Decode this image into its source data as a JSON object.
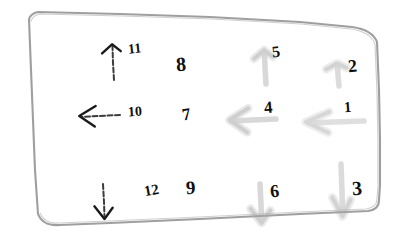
{
  "scene": {
    "medium": "hand-drawn ink sketch on white paper",
    "frame_name": "hand-drawn-rounded-rectangle-border",
    "background_color": "#ffffff",
    "ink_color": "#1a1a1a",
    "faint_ink_color": "#a8a8a8",
    "frame_color": "#8b8b8b"
  },
  "grid": {
    "rows": 3,
    "columns": 4,
    "row_directions": [
      "up",
      "left",
      "down"
    ]
  },
  "items": [
    {
      "label": "11",
      "direction": "up",
      "has_arrow": true,
      "ink": "dark",
      "arrow_x": 96,
      "arrow_y": 38,
      "arrow_w": 26,
      "arrow_h": 38,
      "label_x": 128,
      "label_y": 42,
      "label_size": 14,
      "label_rotate": -6,
      "opacity": 1
    },
    {
      "label": "8",
      "direction": "none",
      "has_arrow": false,
      "ink": "dark",
      "arrow_x": 0,
      "arrow_y": 0,
      "arrow_w": 0,
      "arrow_h": 0,
      "label_x": 176,
      "label_y": 54,
      "label_size": 20,
      "label_rotate": -4,
      "opacity": 1
    },
    {
      "label": "5",
      "direction": "up",
      "has_arrow": true,
      "ink": "faint",
      "arrow_x": 248,
      "arrow_y": 44,
      "arrow_w": 26,
      "arrow_h": 36,
      "label_x": 272,
      "label_y": 44,
      "label_size": 16,
      "label_rotate": -8,
      "opacity": 0.55
    },
    {
      "label": "2",
      "direction": "up",
      "has_arrow": true,
      "ink": "faint",
      "arrow_x": 320,
      "arrow_y": 58,
      "arrow_w": 28,
      "arrow_h": 24,
      "label_x": 348,
      "label_y": 57,
      "label_size": 18,
      "label_rotate": -5,
      "opacity": 0.5
    },
    {
      "label": "10",
      "direction": "left",
      "has_arrow": true,
      "ink": "dark",
      "arrow_x": 74,
      "arrow_y": 100,
      "arrow_w": 42,
      "arrow_h": 24,
      "label_x": 128,
      "label_y": 105,
      "label_size": 14,
      "label_rotate": -4,
      "opacity": 1
    },
    {
      "label": "7",
      "direction": "none",
      "has_arrow": false,
      "ink": "dark",
      "arrow_x": 0,
      "arrow_y": 0,
      "arrow_w": 0,
      "arrow_h": 0,
      "label_x": 182,
      "label_y": 106,
      "label_size": 17,
      "label_rotate": -9,
      "opacity": 1
    },
    {
      "label": "4",
      "direction": "left",
      "has_arrow": true,
      "ink": "faint",
      "arrow_x": 224,
      "arrow_y": 102,
      "arrow_w": 48,
      "arrow_h": 28,
      "label_x": 264,
      "label_y": 99,
      "label_size": 17,
      "label_rotate": -5,
      "opacity": 0.55
    },
    {
      "label": "1",
      "direction": "left",
      "has_arrow": true,
      "ink": "faint",
      "arrow_x": 300,
      "arrow_y": 106,
      "arrow_w": 60,
      "arrow_h": 24,
      "label_x": 344,
      "label_y": 100,
      "label_size": 15,
      "label_rotate": -4,
      "opacity": 0.45
    },
    {
      "label": "12",
      "direction": "down",
      "has_arrow": true,
      "ink": "dark",
      "arrow_x": 88,
      "arrow_y": 180,
      "arrow_w": 24,
      "arrow_h": 36,
      "label_x": 144,
      "label_y": 183,
      "label_size": 15,
      "label_rotate": -10,
      "opacity": 1
    },
    {
      "label": "9",
      "direction": "none",
      "has_arrow": false,
      "ink": "dark",
      "arrow_x": 0,
      "arrow_y": 0,
      "arrow_w": 0,
      "arrow_h": 0,
      "label_x": 186,
      "label_y": 178,
      "label_size": 19,
      "label_rotate": -3,
      "opacity": 1
    },
    {
      "label": "6",
      "direction": "down",
      "has_arrow": true,
      "ink": "faint",
      "arrow_x": 244,
      "arrow_y": 180,
      "arrow_w": 26,
      "arrow_h": 40,
      "label_x": 270,
      "label_y": 182,
      "label_size": 18,
      "label_rotate": -6,
      "opacity": 0.55
    },
    {
      "label": "3",
      "direction": "down",
      "has_arrow": true,
      "ink": "faint",
      "arrow_x": 326,
      "arrow_y": 160,
      "arrow_w": 24,
      "arrow_h": 54,
      "label_x": 352,
      "label_y": 178,
      "label_size": 20,
      "label_rotate": -4,
      "opacity": 0.5
    }
  ]
}
